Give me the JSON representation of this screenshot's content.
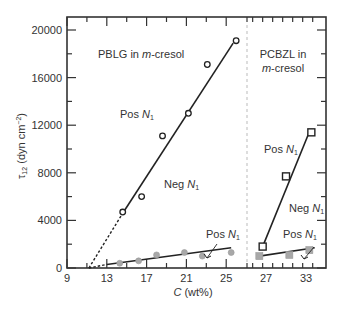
{
  "chart_data": {
    "type": "scatter",
    "title": "",
    "xlabel": "C (wt%)",
    "ylabel": "τ12 (dyn cm−2)",
    "ylim": [
      0,
      21000
    ],
    "yticks": [
      0,
      4000,
      8000,
      12000,
      16000,
      20000
    ],
    "panels": [
      {
        "name": "PBLG in m-cresol",
        "xlim": [
          9,
          27.1
        ],
        "xticks": [
          9,
          13,
          17,
          21,
          25
        ],
        "annotations": [
          {
            "text": "PBLG in ",
            "italic_suffix": "m",
            "suffix": "-cresol",
            "x": 14.5,
            "y": 18400
          },
          {
            "text": "Pos N1",
            "x": 15.5,
            "y": 12400
          },
          {
            "text": "Neg N1",
            "x": 20.0,
            "y": 7200
          },
          {
            "text": "Pos N1",
            "x": 20.5,
            "y": 2400
          }
        ],
        "series": [
          {
            "name": "Pos N1 (open circles)",
            "marker": "circle-open",
            "points": [
              [
                14.6,
                4700
              ],
              [
                16.5,
                6000
              ],
              [
                18.6,
                11100
              ],
              [
                21.2,
                13000
              ],
              [
                23.1,
                17100
              ],
              [
                26.0,
                19100
              ]
            ],
            "fit_line": [
              [
                14.6,
                4600
              ],
              [
                25.7,
                18900
              ]
            ],
            "extrapolation": [
              [
                11.2,
                0
              ],
              [
                14.6,
                4600
              ]
            ]
          },
          {
            "name": "Neg N1 (gray circles)",
            "marker": "circle-gray",
            "points": [
              [
                14.3,
                400
              ],
              [
                16.2,
                600
              ],
              [
                18.0,
                1100
              ],
              [
                20.8,
                1300
              ],
              [
                22.6,
                1000
              ],
              [
                25.5,
                1300
              ]
            ],
            "fit_line": [
              [
                13.0,
                300
              ],
              [
                25.5,
                1700
              ]
            ],
            "extrapolation": [
              [
                11.2,
                0
              ],
              [
                13.0,
                300
              ]
            ]
          }
        ]
      },
      {
        "name": "PCBZL in m-cresol",
        "xlim": [
          24.2,
          36.0
        ],
        "xticks": [
          27,
          33
        ],
        "annotations": [
          {
            "text": "PCBZL in",
            "x": 26.0,
            "y": 18500
          },
          {
            "text": "m-cresol",
            "x": 26.0,
            "y": 17100
          },
          {
            "text": "Pos N1",
            "x": 27.6,
            "y": 9600
          },
          {
            "text": "Neg N1",
            "x": 30.8,
            "y": 4400
          },
          {
            "text": "Pos N1",
            "x": 31.2,
            "y": 2500
          }
        ],
        "series": [
          {
            "name": "Pos N1 (open squares)",
            "marker": "square-open",
            "points": [
              [
                26.5,
                1800
              ],
              [
                30.0,
                7700
              ],
              [
                33.8,
                11400
              ]
            ],
            "fit_line": [
              [
                26.5,
                1800
              ],
              [
                33.4,
                11300
              ]
            ]
          },
          {
            "name": "Neg N1 (gray squares)",
            "marker": "square-gray",
            "points": [
              [
                26.0,
                1000
              ],
              [
                30.5,
                1100
              ],
              [
                33.5,
                1500
              ]
            ],
            "fit_line": [
              [
                26.0,
                1000
              ],
              [
                34.3,
                1700
              ]
            ]
          }
        ]
      }
    ]
  },
  "labels": {
    "y_axis": "τ12 (dyn cm−2)",
    "x_axis": "C (wt%)",
    "panel_left_title": "PBLG in m-cresol",
    "panel_right_title_line1": "PCBZL in",
    "panel_right_title_line2": "m-cresol"
  },
  "colors": {
    "axis": "#333333",
    "line": "#222222",
    "gray_marker": "#a8a8a8",
    "divider": "#bbbbbb"
  }
}
